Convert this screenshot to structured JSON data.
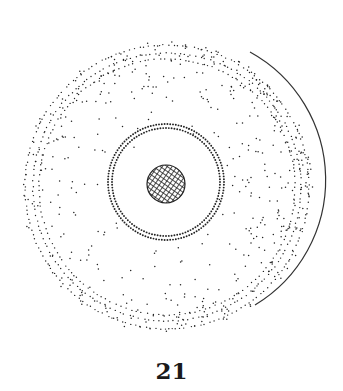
{
  "figure": {
    "label": "21",
    "colors": {
      "ink": "#222222",
      "background": "#ffffff"
    },
    "outer_disc": {
      "cx": 167,
      "cy": 187,
      "r": 146
    },
    "inner_ring": {
      "cx": 166,
      "cy": 182,
      "r": 58
    },
    "nucleus": {
      "cx": 166,
      "cy": 184,
      "r": 19
    }
  }
}
